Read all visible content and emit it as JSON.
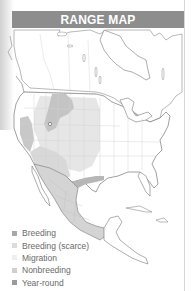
{
  "header": {
    "title": "RANGE MAP"
  },
  "map": {
    "region": "North America",
    "colors": {
      "land": "#ffffff",
      "border": "#cfcfcf",
      "coast": "#777777",
      "breeding": "#c2c2c2",
      "breeding_scarce": "#e4e4e4",
      "migration": "#f2f2f2",
      "nonbreeding": "#dadada",
      "year_round": "#b4b4b4"
    }
  },
  "legend": {
    "items": [
      {
        "label": "Breeding",
        "color": "#a8a8a8"
      },
      {
        "label": "Breeding (scarce)",
        "color": "#dcdcdc"
      },
      {
        "label": "Migration",
        "color": "#efefef"
      },
      {
        "label": "Nonbreeding",
        "color": "#d0d0d0"
      },
      {
        "label": "Year-round",
        "color": "#9a9a9a"
      }
    ]
  }
}
